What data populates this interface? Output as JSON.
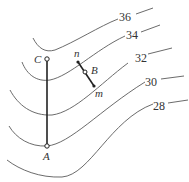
{
  "diagram": {
    "type": "contour-map",
    "contours": [
      {
        "value": "36",
        "label_x": 118,
        "label_y": 22
      },
      {
        "value": "34",
        "label_x": 128,
        "label_y": 40
      },
      {
        "value": "32",
        "label_x": 137,
        "label_y": 63
      },
      {
        "value": "30",
        "label_x": 147,
        "label_y": 87
      },
      {
        "value": "28",
        "label_x": 154,
        "label_y": 111
      }
    ],
    "points": {
      "C": {
        "label": "C",
        "x": 47,
        "y": 59
      },
      "A": {
        "label": "A",
        "x": 47,
        "y": 146
      },
      "n": {
        "label": "n",
        "x": 77,
        "y": 62
      },
      "B": {
        "label": "B",
        "x": 85,
        "y": 72
      },
      "m": {
        "label": "m",
        "x": 94,
        "y": 86
      }
    },
    "segments": [
      "CA",
      "nm"
    ]
  }
}
